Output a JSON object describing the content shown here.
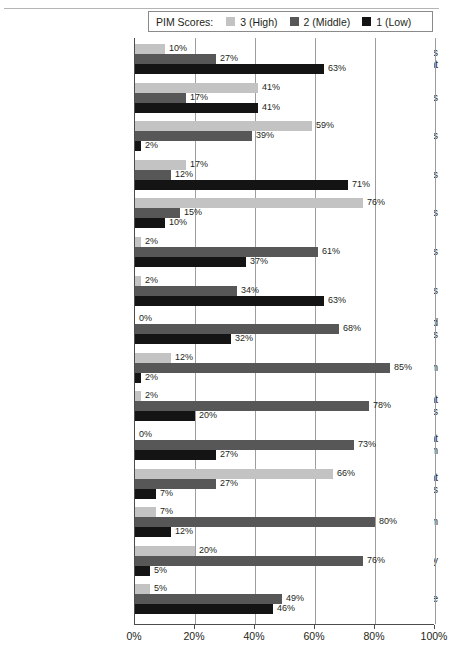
{
  "legend": {
    "title": "PIM Scores:",
    "items": [
      {
        "label": "3 (High)",
        "color": "#c3c3c3"
      },
      {
        "label": "2 (Middle)",
        "color": "#575757"
      },
      {
        "label": "1 (Low)",
        "color": "#141414"
      }
    ]
  },
  "axis": {
    "xticks": [
      "0%",
      "20%",
      "40%",
      "60%",
      "80%",
      "100%"
    ],
    "xtick_values": [
      0,
      20,
      40,
      60,
      80,
      100
    ]
  },
  "chart_data": {
    "type": "bar",
    "orientation": "horizontal",
    "title": "",
    "xlabel": "",
    "ylabel": "",
    "xlim": [
      0,
      100
    ],
    "grid": true,
    "legend_position": "top",
    "legend_title": "PIM Scores:",
    "categories": [
      "Comprehensive Needs Assessment",
      "Inquiry Process",
      "Specific Goals",
      "Measurable Goals",
      "Achievable Goals",
      "Relevant Goals",
      "Timely Goals",
      "Targeted Research-Based Strategies",
      "Master Plan Design",
      "Professional Development Emphasis",
      "Professional Development Implementation",
      "Parental Involvement Strategies",
      "Monitoring Plan",
      "Monitoring Frequency",
      "Evaluation Cycle"
    ],
    "series": [
      {
        "name": "3 (High)",
        "color": "#c3c3c3",
        "values": [
          10,
          41,
          59,
          17,
          76,
          2,
          2,
          0,
          12,
          2,
          0,
          66,
          7,
          20,
          5
        ],
        "labels": [
          "10%",
          "41%",
          "59%",
          "17%",
          "76%",
          "2%",
          "2%",
          "0%",
          "12%",
          "2%",
          "0%",
          "66%",
          "7%",
          "20%",
          "5%"
        ]
      },
      {
        "name": "2 (Middle)",
        "color": "#575757",
        "values": [
          27,
          17,
          39,
          12,
          15,
          61,
          34,
          68,
          85,
          78,
          73,
          27,
          80,
          76,
          49
        ],
        "labels": [
          "27%",
          "17%",
          "39%",
          "12%",
          "15%",
          "61%",
          "34%",
          "68%",
          "85%",
          "78%",
          "73%",
          "27%",
          "80%",
          "76%",
          "49%"
        ]
      },
      {
        "name": "1 (Low)",
        "color": "#141414",
        "values": [
          63,
          41,
          2,
          71,
          10,
          37,
          63,
          32,
          2,
          20,
          27,
          7,
          12,
          5,
          46
        ],
        "labels": [
          "63%",
          "41%",
          "2%",
          "71%",
          "10%",
          "37%",
          "63%",
          "32%",
          "2%",
          "20%",
          "27%",
          "7%",
          "12%",
          "5%",
          "46%"
        ]
      }
    ]
  }
}
